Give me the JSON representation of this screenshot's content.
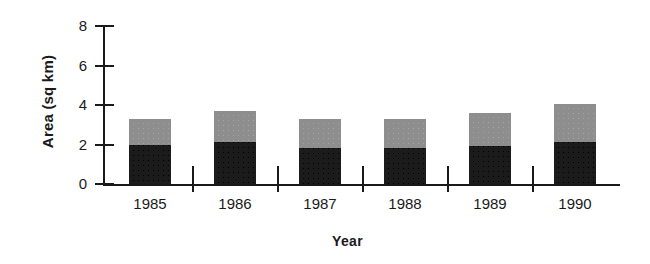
{
  "chart_data": {
    "type": "bar",
    "stacked": true,
    "title": "",
    "xlabel": "Year",
    "ylabel": "Area (sq km)",
    "categories": [
      "1985",
      "1986",
      "1987",
      "1988",
      "1989",
      "1990"
    ],
    "series": [
      {
        "name": "lower",
        "color": "#1b1b1b",
        "values": [
          2.0,
          2.15,
          1.85,
          1.85,
          1.95,
          2.15
        ]
      },
      {
        "name": "upper",
        "color": "#8e8e8e",
        "values": [
          1.3,
          1.55,
          1.45,
          1.45,
          1.65,
          1.9
        ]
      }
    ],
    "totals": [
      3.3,
      3.7,
      3.3,
      3.3,
      3.6,
      4.05
    ],
    "ylim": [
      0,
      8
    ],
    "yticks": [
      "0",
      "2",
      "4",
      "6",
      "8"
    ],
    "ytick_values": [
      0,
      2,
      4,
      6,
      8
    ],
    "grid": false,
    "legend": "none"
  }
}
